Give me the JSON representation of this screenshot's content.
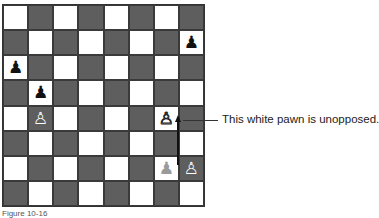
{
  "diagram": {
    "type": "chess-board",
    "board": {
      "files": [
        "a",
        "b",
        "c",
        "d",
        "e",
        "f",
        "g",
        "h"
      ],
      "ranks": [
        8,
        7,
        6,
        5,
        4,
        3,
        2,
        1
      ],
      "light_color": "#ffffff",
      "dark_color": "#5e5e5e",
      "pieces": [
        {
          "square": "h7",
          "color": "black",
          "type": "pawn",
          "glyph": "♟"
        },
        {
          "square": "a6",
          "color": "black",
          "type": "pawn",
          "glyph": "♟"
        },
        {
          "square": "b5",
          "color": "black",
          "type": "pawn",
          "glyph": "♟"
        },
        {
          "square": "b4",
          "color": "white",
          "type": "pawn",
          "glyph": "♙"
        },
        {
          "square": "g4",
          "color": "white",
          "type": "pawn",
          "glyph": "♙"
        },
        {
          "square": "g2",
          "color": "ghost",
          "type": "pawn",
          "glyph": "♟"
        },
        {
          "square": "h2",
          "color": "white",
          "type": "pawn",
          "glyph": "♙"
        }
      ],
      "arrows": [
        {
          "from": "g2",
          "to": "g4"
        }
      ]
    },
    "annotation": {
      "target_square": "g4",
      "text": "This white pawn is unopposed."
    },
    "caption": "Figure 10-16"
  }
}
